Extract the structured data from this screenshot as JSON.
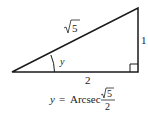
{
  "diagram": {
    "type": "right-triangle",
    "hypotenuse_label": "√5",
    "hypotenuse_radicand": "5",
    "opposite_label": "1",
    "adjacent_label": "2",
    "angle_label": "y",
    "colors": {
      "stroke": "#1a1a1a",
      "text": "#222222",
      "background": "#ffffff"
    }
  },
  "formula": {
    "lhs": "y",
    "equals": "=",
    "function": "Arcsec",
    "numerator": "√5",
    "numerator_radicand": "5",
    "denominator": "2"
  }
}
